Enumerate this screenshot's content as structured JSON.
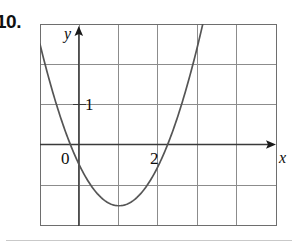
{
  "problem": {
    "number_label": "10."
  },
  "figure": {
    "name": "parabola-graph",
    "axis_labels": {
      "x": "x",
      "y": "y"
    },
    "tick_labels": {
      "origin": "0",
      "y_one": "1",
      "x_two": "2"
    }
  },
  "colors": {
    "curve": "#555555",
    "axis": "#3a3a3a",
    "grid": "#8c8c8c",
    "border": "#6e6e6e",
    "text": "#0d0d0d",
    "page_rule": "#c9c9c9",
    "background": "#ffffff"
  },
  "chart_data": {
    "type": "line",
    "title": "",
    "subtitle": "",
    "xlabel": "x",
    "ylabel": "y",
    "function": "y = x^2 - 2x",
    "xlim": [
      -1,
      5
    ],
    "ylim": [
      -1.5,
      3.5
    ],
    "x_ticks": [
      -1,
      0,
      1,
      2,
      3,
      4,
      5
    ],
    "y_ticks": [
      -1,
      0,
      1,
      2,
      3
    ],
    "x_tick_labels_shown": [
      "0",
      "2"
    ],
    "y_tick_labels_shown": [
      "1"
    ],
    "grid": true,
    "grid_spacing_x": 1,
    "grid_spacing_y": 1,
    "legend": null,
    "axes_arrows": [
      "x-positive",
      "y-positive"
    ],
    "roots": [
      0,
      2
    ],
    "vertex": [
      1,
      -1
    ],
    "series": [
      {
        "name": "y = x^2 - 2x",
        "x": [
          -0.41,
          -0.2,
          0,
          0.25,
          0.5,
          0.75,
          1,
          1.25,
          1.5,
          1.75,
          2,
          2.25,
          2.5,
          2.75,
          3,
          3.2,
          3.41
        ],
        "y": [
          0.99,
          0.44,
          0,
          -0.4375,
          -0.75,
          -0.9375,
          -1,
          -0.9375,
          -0.75,
          -0.4375,
          0,
          0.5625,
          1.25,
          2.0625,
          3,
          3.84,
          4.81
        ]
      }
    ]
  }
}
